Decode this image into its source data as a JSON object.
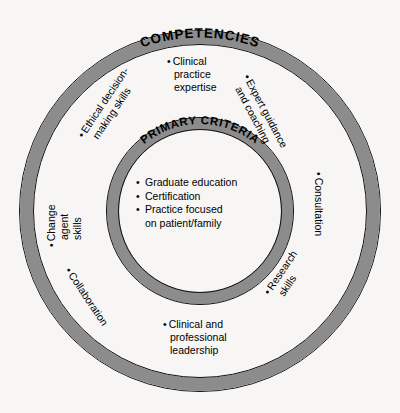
{
  "diagram": {
    "type": "concentric-circles",
    "colors": {
      "band": "#8c8c8c",
      "outline": "#111111",
      "background": "#f7f6f4",
      "text": "#000000"
    },
    "outer_ring": {
      "title": "COMPETENCIES"
    },
    "inner_ring": {
      "title": "PRIMARY CRITERIA"
    },
    "center": {
      "items": [
        {
          "bullet": "•",
          "line1": "Graduate education",
          "line2": ""
        },
        {
          "bullet": "•",
          "line1": "Certification",
          "line2": ""
        },
        {
          "bullet": "•",
          "line1": "Practice focused",
          "line2": "on patient/family"
        }
      ]
    },
    "competencies": [
      {
        "name": "clinical-practice-expertise",
        "bullet": "•",
        "line1": "Clinical",
        "line2": "practice",
        "line3": "expertise"
      },
      {
        "name": "expert-guidance-and-coaching",
        "bullet": "•",
        "line1": "Expert guidance",
        "line2": "and coaching",
        "line3": ""
      },
      {
        "name": "consultation",
        "bullet": "•",
        "line1": "Consultation",
        "line2": "",
        "line3": ""
      },
      {
        "name": "research-skills",
        "bullet": "•",
        "line1": "Research",
        "line2": "skills",
        "line3": ""
      },
      {
        "name": "clinical-and-professional-leadership",
        "bullet": "•",
        "line1": "Clinical and",
        "line2": "professional",
        "line3": "leadership"
      },
      {
        "name": "collaboration",
        "bullet": "•",
        "line1": "Collaboration",
        "line2": "",
        "line3": ""
      },
      {
        "name": "change-agent-skills",
        "bullet": "•",
        "line1": "Change",
        "line2": "agent",
        "line3": "skills"
      },
      {
        "name": "ethical-decision-making-skills",
        "bullet": "•",
        "line1": "Ethical decision-",
        "line2": "making skills",
        "line3": ""
      }
    ]
  }
}
